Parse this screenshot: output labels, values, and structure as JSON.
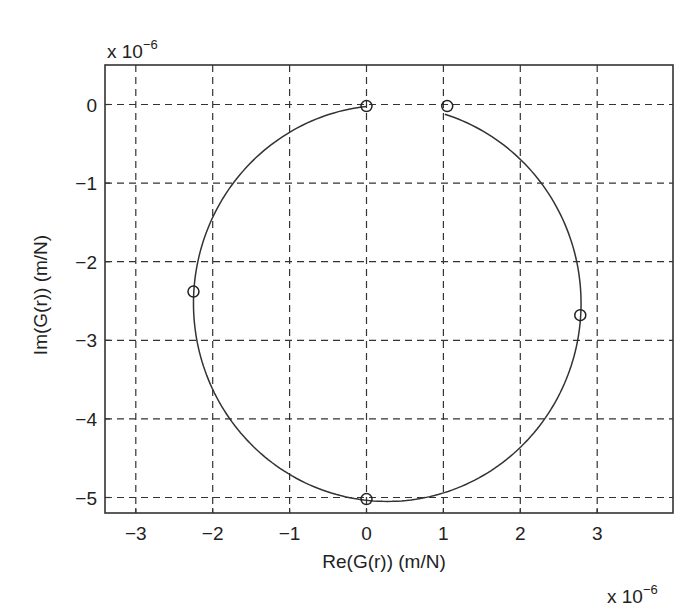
{
  "chart_data": {
    "type": "scatter",
    "title": "",
    "xlabel": "Re(G(r)) (m/N)",
    "ylabel": "Im(G(r)) (m/N)",
    "x_multiplier": "x 10",
    "x_multiplier_exp": "−6",
    "y_multiplier": "x 10",
    "y_multiplier_exp": "−6",
    "xlim": [
      -3.4,
      3.95
    ],
    "ylim": [
      -5.2,
      0.45
    ],
    "xticks": [
      -3,
      -2,
      -1,
      0,
      1,
      2,
      3
    ],
    "xtick_labels": [
      "−3",
      "−2",
      "−1",
      "0",
      "1",
      "2",
      "3"
    ],
    "yticks": [
      0,
      -1,
      -2,
      -3,
      -4,
      -5
    ],
    "ytick_labels": [
      "0",
      "−1",
      "−2",
      "−3",
      "−4",
      "−5"
    ],
    "grid": true,
    "legend": null,
    "series": [
      {
        "name": "Nyquist curve",
        "kind": "line",
        "shape": "circle-arc",
        "center": [
          0.27,
          -2.53
        ],
        "radius_x": 2.52,
        "radius_y": 2.52,
        "start_point": [
          1.05,
          -0.02
        ],
        "end_point": [
          0.0,
          -0.02
        ],
        "direction": "clockwise via right side, bottom, left side",
        "points": [
          [
            1.05,
            -0.02
          ],
          [
            2.0,
            -0.55
          ],
          [
            2.6,
            -1.5
          ],
          [
            2.78,
            -2.68
          ],
          [
            2.45,
            -3.9
          ],
          [
            1.7,
            -4.6
          ],
          [
            0.9,
            -4.95
          ],
          [
            0.3,
            -5.05
          ],
          [
            0.0,
            -5.02
          ],
          [
            -0.9,
            -4.75
          ],
          [
            -1.7,
            -4.1
          ],
          [
            -2.15,
            -3.2
          ],
          [
            -2.25,
            -2.38
          ],
          [
            -2.05,
            -1.4
          ],
          [
            -1.45,
            -0.6
          ],
          [
            -0.6,
            -0.12
          ],
          [
            0.0,
            -0.02
          ]
        ]
      },
      {
        "name": "Markers",
        "kind": "marker",
        "marker": "circle",
        "points": [
          [
            0.0,
            -0.02
          ],
          [
            1.05,
            -0.02
          ],
          [
            -2.25,
            -2.38
          ],
          [
            2.78,
            -2.68
          ],
          [
            0.0,
            -5.02
          ]
        ]
      }
    ]
  },
  "layout": {
    "plot_px": {
      "left": 105,
      "top": 65,
      "right": 673,
      "bottom": 513
    },
    "x_px_per_unit": 76.9,
    "x_zero_px": 366.5,
    "y_px_per_unit": 78.6,
    "y_zero_px": 104.5
  }
}
